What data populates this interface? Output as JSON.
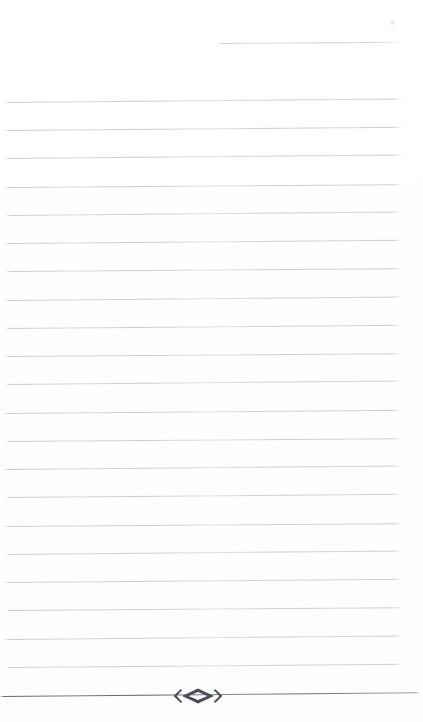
{
  "page": {
    "width": 423,
    "height": 722,
    "background_color": "#ffffff",
    "type": "ruled-writing-page",
    "text_content": "",
    "note": "blank lined page scan, no written text"
  },
  "ink": {
    "body_rule_color": "#9a9ca2",
    "final_rule_color": "#54565f",
    "ornament_color": "#4a4c55"
  },
  "rules": {
    "partial_top": {
      "label": "partial-top-rule",
      "y": 43,
      "x_start": 217,
      "x_end": 403,
      "rotation_deg": -0.35
    },
    "body": [
      {
        "y": 102,
        "x_start": 5,
        "x_end": 403,
        "rotation_deg": -0.5
      },
      {
        "y": 130,
        "x_start": 4,
        "x_end": 404,
        "rotation_deg": -0.45
      },
      {
        "y": 158,
        "x_start": 5,
        "x_end": 403,
        "rotation_deg": -0.5
      },
      {
        "y": 187,
        "x_start": 4,
        "x_end": 404,
        "rotation_deg": -0.4
      },
      {
        "y": 215,
        "x_start": 5,
        "x_end": 403,
        "rotation_deg": -0.5
      },
      {
        "y": 243,
        "x_start": 4,
        "x_end": 404,
        "rotation_deg": -0.45
      },
      {
        "y": 271,
        "x_start": 5,
        "x_end": 403,
        "rotation_deg": -0.4
      },
      {
        "y": 300,
        "x_start": 4,
        "x_end": 404,
        "rotation_deg": -0.5
      },
      {
        "y": 328,
        "x_start": 5,
        "x_end": 403,
        "rotation_deg": -0.45
      },
      {
        "y": 356,
        "x_start": 4,
        "x_end": 404,
        "rotation_deg": -0.4
      },
      {
        "y": 384,
        "x_start": 5,
        "x_end": 403,
        "rotation_deg": -0.5
      },
      {
        "y": 413,
        "x_start": 4,
        "x_end": 404,
        "rotation_deg": -0.45
      },
      {
        "y": 441,
        "x_start": 5,
        "x_end": 403,
        "rotation_deg": -0.4
      },
      {
        "y": 469,
        "x_start": 4,
        "x_end": 404,
        "rotation_deg": -0.5
      },
      {
        "y": 497,
        "x_start": 5,
        "x_end": 403,
        "rotation_deg": -0.45
      },
      {
        "y": 526,
        "x_start": 4,
        "x_end": 404,
        "rotation_deg": -0.4
      },
      {
        "y": 554,
        "x_start": 5,
        "x_end": 403,
        "rotation_deg": -0.5
      },
      {
        "y": 582,
        "x_start": 4,
        "x_end": 404,
        "rotation_deg": -0.45
      },
      {
        "y": 610,
        "x_start": 5,
        "x_end": 403,
        "rotation_deg": -0.4
      },
      {
        "y": 639,
        "x_start": 4,
        "x_end": 404,
        "rotation_deg": -0.5
      },
      {
        "y": 667,
        "x_start": 5,
        "x_end": 404,
        "rotation_deg": -0.45
      }
    ],
    "final_ornamental": {
      "label": "final-ornamental-rule",
      "y": 696,
      "x_start": 0,
      "x_end": 420,
      "rotation_deg": -0.5
    }
  },
  "ornament": {
    "label": "diamond-fleuron",
    "glyph": "‹◇›",
    "center_x": 198,
    "center_y": 696,
    "width": 54,
    "height": 16,
    "color": "#4a4c55"
  },
  "artifacts": {
    "smudge": {
      "x": 389,
      "y": 19,
      "size": 7
    }
  }
}
